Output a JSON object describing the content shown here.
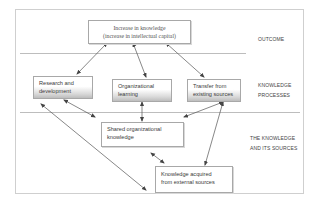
{
  "diagram": {
    "nodes": {
      "outcome": {
        "lines": [
          "Increase in knowledge",
          "(increase in intellectual capital)"
        ]
      },
      "research": {
        "lines": [
          "Research and",
          "development"
        ]
      },
      "learning": {
        "lines": [
          "Organizational",
          "learning"
        ]
      },
      "transfer": {
        "lines": [
          "Transfer  from",
          "existing sources"
        ]
      },
      "shared": {
        "lines": [
          "Shared organizational",
          "knowledge"
        ]
      },
      "external": {
        "lines": [
          "Knowledge acquired",
          "from external sources"
        ]
      }
    },
    "tiers": [
      {
        "lines": [
          "OUTCOME"
        ]
      },
      {
        "lines": [
          "KNOWLEDGE",
          "PROCESSES"
        ]
      },
      {
        "lines": [
          "THE KNOWLEDGE",
          "AND ITS SOURCES"
        ]
      }
    ],
    "edges": [
      {
        "from": "outcome",
        "to": "research",
        "direction": "both"
      },
      {
        "from": "outcome",
        "to": "learning",
        "direction": "both"
      },
      {
        "from": "outcome",
        "to": "transfer",
        "direction": "both"
      },
      {
        "from": "research",
        "to": "shared",
        "direction": "both"
      },
      {
        "from": "learning",
        "to": "shared",
        "direction": "both"
      },
      {
        "from": "transfer",
        "to": "shared",
        "direction": "both"
      },
      {
        "from": "transfer",
        "to": "external",
        "direction": "both"
      },
      {
        "from": "research",
        "to": "external",
        "direction": "both"
      },
      {
        "from": "shared",
        "to": "external",
        "direction": "both"
      }
    ],
    "colors": {
      "line": "#555555",
      "box_border": "#a8a8a8",
      "gradient_bottom": "#bdbdbd",
      "divider": "#bdbdbd"
    }
  }
}
